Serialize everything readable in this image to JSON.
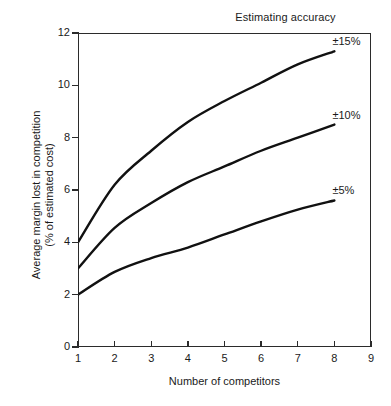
{
  "chart_data": {
    "type": "line",
    "title": "Estimating accuracy",
    "xlabel": "Number of competitors",
    "ylabel_line1": "Average margin lost in competition",
    "ylabel_line2": "(% of estimated cost)",
    "xlim": [
      1,
      9
    ],
    "ylim": [
      0,
      12
    ],
    "xticks": [
      1,
      2,
      3,
      4,
      5,
      6,
      7,
      8,
      9
    ],
    "yticks": [
      0,
      2,
      4,
      6,
      8,
      10,
      12
    ],
    "xtick_labels": [
      "1",
      "2",
      "3",
      "4",
      "5",
      "6",
      "7",
      "8",
      "9"
    ],
    "ytick_labels": [
      "0",
      "2",
      "4",
      "6",
      "8",
      "10",
      "12"
    ],
    "grid": false,
    "legend_position": "line-end-labels",
    "x": [
      1,
      2,
      3,
      4,
      5,
      6,
      7,
      8
    ],
    "series": [
      {
        "name": "±15%",
        "label": "±15%",
        "color": "#111111",
        "values": [
          4.0,
          6.2,
          7.5,
          8.6,
          9.4,
          10.1,
          10.8,
          11.3
        ]
      },
      {
        "name": "±10%",
        "label": "±10%",
        "color": "#111111",
        "values": [
          3.0,
          4.55,
          5.5,
          6.3,
          6.9,
          7.5,
          8.0,
          8.5
        ]
      },
      {
        "name": "±5%",
        "label": "±5%",
        "color": "#111111",
        "values": [
          2.0,
          2.87,
          3.4,
          3.8,
          4.3,
          4.8,
          5.25,
          5.6
        ]
      }
    ]
  },
  "axis": {
    "x_title": "Number of competitors",
    "y_title_line1": "Average margin lost in competition",
    "y_title_line2": "(% of estimated cost)"
  },
  "title": {
    "text": "Estimating accuracy"
  }
}
